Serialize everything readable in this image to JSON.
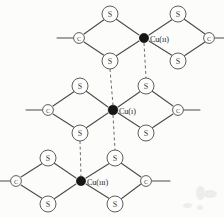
{
  "figure": {
    "background_color": "#fcfcfb",
    "bond_color": "#4a4a4a",
    "bridge_color": "#6e6e6e",
    "metal_color": "#161616",
    "atom_outline_color": "#555555"
  },
  "metal_centers": [
    {
      "id": "cu-top",
      "label": "Cu(ıı)",
      "x": 144,
      "y": 38,
      "radius": 4.6,
      "label_x": 150,
      "label_y": 39
    },
    {
      "id": "cu-middle",
      "label": "Cu(ı)",
      "x": 113,
      "y": 110,
      "radius": 4.8,
      "label_x": 119,
      "label_y": 111
    },
    {
      "id": "cu-bottom",
      "label": "Cu(ııı)",
      "x": 81,
      "y": 181,
      "radius": 4.6,
      "label_x": 87,
      "label_y": 182
    }
  ],
  "sulfur_atoms": [
    {
      "id": "s-top-left-upper",
      "label": "S",
      "x": 110,
      "y": 14,
      "radius": 8.0
    },
    {
      "id": "s-top-left-lower",
      "label": "S",
      "x": 110,
      "y": 61,
      "radius": 8.0
    },
    {
      "id": "s-top-right-upper",
      "label": "S",
      "x": 178,
      "y": 14,
      "radius": 8.0
    },
    {
      "id": "s-top-right-lower",
      "label": "S",
      "x": 178,
      "y": 61,
      "radius": 8.0
    },
    {
      "id": "s-mid-left-upper",
      "label": "S",
      "x": 80,
      "y": 86,
      "radius": 8.0
    },
    {
      "id": "s-mid-left-lower",
      "label": "S",
      "x": 80,
      "y": 133,
      "radius": 8.0
    },
    {
      "id": "s-mid-right-upper",
      "label": "S",
      "x": 146,
      "y": 86,
      "radius": 8.0
    },
    {
      "id": "s-mid-right-lower",
      "label": "S",
      "x": 146,
      "y": 133,
      "radius": 8.0
    },
    {
      "id": "s-bot-left-upper",
      "label": "S",
      "x": 48,
      "y": 158,
      "radius": 8.0
    },
    {
      "id": "s-bot-left-lower",
      "label": "S",
      "x": 48,
      "y": 204,
      "radius": 8.0
    },
    {
      "id": "s-bot-right-upper",
      "label": "S",
      "x": 115,
      "y": 158,
      "radius": 8.0
    },
    {
      "id": "s-bot-right-lower",
      "label": "S",
      "x": 115,
      "y": 204,
      "radius": 8.0
    }
  ],
  "carbon_atoms": [
    {
      "id": "c-top-left",
      "label": "C",
      "x": 79,
      "y": 38,
      "radius": 5.4
    },
    {
      "id": "c-top-right",
      "label": "C",
      "x": 209,
      "y": 38,
      "radius": 5.4
    },
    {
      "id": "c-mid-left",
      "label": "C",
      "x": 48,
      "y": 110,
      "radius": 5.4
    },
    {
      "id": "c-mid-right",
      "label": "C",
      "x": 178,
      "y": 110,
      "radius": 5.4
    },
    {
      "id": "c-bot-left",
      "label": "C",
      "x": 16,
      "y": 181,
      "radius": 5.4
    },
    {
      "id": "c-bot-right",
      "label": "C",
      "x": 146,
      "y": 181,
      "radius": 5.4
    }
  ],
  "terminal_bonds": [
    {
      "id": "term-top-left",
      "x1": 57,
      "y1": 38,
      "x2": 73,
      "y2": 38
    },
    {
      "id": "term-top-right",
      "x1": 215,
      "y1": 38,
      "x2": 224,
      "y2": 38
    },
    {
      "id": "term-mid-left",
      "x1": 26,
      "y1": 110,
      "x2": 42,
      "y2": 110
    },
    {
      "id": "term-mid-right",
      "x1": 184,
      "y1": 110,
      "x2": 200,
      "y2": 110
    },
    {
      "id": "term-bot-left",
      "x1": 0,
      "y1": 181,
      "x2": 10,
      "y2": 181
    },
    {
      "id": "term-bot-right",
      "x1": 152,
      "y1": 181,
      "x2": 170,
      "y2": 181
    }
  ],
  "ring_bonds": [
    {
      "id": "b1",
      "x1": 84,
      "y1": 34,
      "x2": 105,
      "y2": 19
    },
    {
      "id": "b2",
      "x1": 116,
      "y1": 19,
      "x2": 139,
      "y2": 35
    },
    {
      "id": "b3",
      "x1": 84,
      "y1": 42,
      "x2": 105,
      "y2": 56
    },
    {
      "id": "b4",
      "x1": 116,
      "y1": 56,
      "x2": 139,
      "y2": 41
    },
    {
      "id": "b5",
      "x1": 149,
      "y1": 35,
      "x2": 173,
      "y2": 19
    },
    {
      "id": "b6",
      "x1": 184,
      "y1": 19,
      "x2": 205,
      "y2": 34
    },
    {
      "id": "b7",
      "x1": 149,
      "y1": 41,
      "x2": 173,
      "y2": 56
    },
    {
      "id": "b8",
      "x1": 184,
      "y1": 56,
      "x2": 205,
      "y2": 42
    },
    {
      "id": "b9",
      "x1": 53,
      "y1": 106,
      "x2": 75,
      "y2": 91
    },
    {
      "id": "b10",
      "x1": 86,
      "y1": 91,
      "x2": 108,
      "y2": 107
    },
    {
      "id": "b11",
      "x1": 53,
      "y1": 114,
      "x2": 75,
      "y2": 128
    },
    {
      "id": "b12",
      "x1": 86,
      "y1": 128,
      "x2": 108,
      "y2": 113
    },
    {
      "id": "b13",
      "x1": 118,
      "y1": 107,
      "x2": 141,
      "y2": 91
    },
    {
      "id": "b14",
      "x1": 152,
      "y1": 91,
      "x2": 173,
      "y2": 106
    },
    {
      "id": "b15",
      "x1": 118,
      "y1": 113,
      "x2": 141,
      "y2": 128
    },
    {
      "id": "b16",
      "x1": 152,
      "y1": 128,
      "x2": 173,
      "y2": 114
    },
    {
      "id": "b17",
      "x1": 21,
      "y1": 177,
      "x2": 43,
      "y2": 163
    },
    {
      "id": "b18",
      "x1": 54,
      "y1": 163,
      "x2": 76,
      "y2": 178
    },
    {
      "id": "b19",
      "x1": 21,
      "y1": 185,
      "x2": 43,
      "y2": 199
    },
    {
      "id": "b20",
      "x1": 54,
      "y1": 199,
      "x2": 76,
      "y2": 184
    },
    {
      "id": "b21",
      "x1": 86,
      "y1": 178,
      "x2": 110,
      "y2": 163
    },
    {
      "id": "b22",
      "x1": 121,
      "y1": 163,
      "x2": 141,
      "y2": 177
    },
    {
      "id": "b23",
      "x1": 86,
      "y1": 184,
      "x2": 110,
      "y2": 199
    },
    {
      "id": "b24",
      "x1": 121,
      "y1": 199,
      "x2": 141,
      "y2": 184
    }
  ],
  "bridge_bonds": [
    {
      "id": "bridge-top-to-s-mid-right",
      "x1": 144,
      "y1": 43,
      "x2": 146,
      "y2": 78
    },
    {
      "id": "bridge-s-top-left-to-mid",
      "x1": 110,
      "y1": 69,
      "x2": 113,
      "y2": 105
    },
    {
      "id": "bridge-mid-to-s-bot-right",
      "x1": 113,
      "y1": 115,
      "x2": 115,
      "y2": 150
    },
    {
      "id": "bridge-s-mid-left-to-bot",
      "x1": 80,
      "y1": 141,
      "x2": 81,
      "y2": 176
    }
  ],
  "specks": [
    {
      "id": "speck-1",
      "x": 196,
      "y": 186,
      "w": 9,
      "h": 14
    },
    {
      "id": "speck-2",
      "x": 203,
      "y": 190,
      "w": 14,
      "h": 8
    },
    {
      "id": "speck-3",
      "x": 183,
      "y": 203,
      "w": 9,
      "h": 5
    },
    {
      "id": "speck-4",
      "x": 197,
      "y": 205,
      "w": 6,
      "h": 5
    }
  ]
}
